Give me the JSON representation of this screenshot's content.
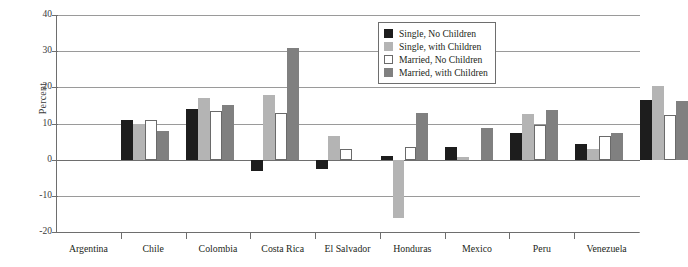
{
  "chart_data": {
    "type": "bar",
    "title": "",
    "xlabel": "",
    "ylabel": "Percent",
    "ylim": [
      -20,
      40
    ],
    "yticks": [
      40,
      30,
      20,
      10,
      0,
      -10,
      -20
    ],
    "ytick_labels": [
      "40",
      "30",
      "20",
      "10",
      "0",
      "-10",
      "-20"
    ],
    "grid": true,
    "legend_position": "top-right-inset",
    "categories": [
      "Argentina",
      "Chile",
      "Colombia",
      "Costa Rica",
      "El Salvador",
      "Honduras",
      "Mexico",
      "Peru",
      "Venezuela"
    ],
    "series": [
      {
        "name": "Single, No Children",
        "color": "#1d1d1d",
        "values": [
          11.0,
          14.0,
          -3.0,
          -2.5,
          1.0,
          3.5,
          7.5,
          4.3,
          16.5
        ]
      },
      {
        "name": "Single, with Children",
        "color": "#b4b4b4",
        "values": [
          10.0,
          17.0,
          18.0,
          6.5,
          -16.0,
          0.8,
          12.7,
          3.0,
          20.5
        ]
      },
      {
        "name": "Married, No Children",
        "color": "#ffffff",
        "values": [
          11.0,
          13.5,
          13.0,
          3.0,
          3.5,
          0.0,
          9.5,
          6.5,
          12.3
        ]
      },
      {
        "name": "Married, with Children",
        "color": "#808080",
        "values": [
          8.0,
          15.0,
          31.0,
          0.0,
          13.0,
          8.7,
          13.7,
          7.3,
          16.3
        ]
      }
    ]
  },
  "legend": {
    "items": [
      {
        "label": "Single, No Children",
        "swatch": "swatch-single-no-children"
      },
      {
        "label": "Single, with Children",
        "swatch": "swatch-single-with-children"
      },
      {
        "label": "Married, No Children",
        "swatch": "swatch-married-no-children"
      },
      {
        "label": "Married, with Children",
        "swatch": "swatch-married-with-children"
      }
    ]
  }
}
